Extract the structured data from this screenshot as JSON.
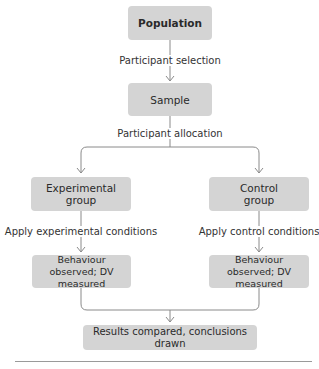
{
  "diagram": {
    "nodes": {
      "population": "Population",
      "sample": "Sample",
      "experimental_group": "Experimental group",
      "control_group": "Control group",
      "behaviour_left": "Behaviour observed; DV measured",
      "behaviour_right": "Behaviour observed; DV measured",
      "results": "Results compared, conclusions drawn"
    },
    "edge_labels": {
      "participant_selection": "Participant selection",
      "participant_allocation": "Participant allocation",
      "apply_experimental": "Apply experimental conditions",
      "apply_control": "Apply control conditions"
    },
    "colors": {
      "box_fill": "#d4d4d4",
      "line": "#8a8a8a",
      "text": "#2a2a2a"
    }
  }
}
